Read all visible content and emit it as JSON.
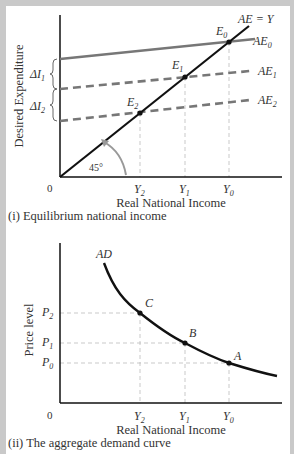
{
  "panel1": {
    "caption": "(i) Equilibrium national income",
    "ylabel": "Desired Expenditure",
    "xlabel": "Real National Income",
    "origin_label": "0",
    "angle_label": "45°",
    "line_label": "AE = Y",
    "x_ticks": [
      {
        "label": "Y",
        "sub": "2"
      },
      {
        "label": "Y",
        "sub": "1"
      },
      {
        "label": "Y",
        "sub": "0"
      }
    ],
    "curves": [
      {
        "label": "AE",
        "sub": "0",
        "style": "solid"
      },
      {
        "label": "AE",
        "sub": "1",
        "style": "dashed"
      },
      {
        "label": "AE",
        "sub": "2",
        "style": "dashed"
      }
    ],
    "points": [
      {
        "label": "E",
        "sub": "0"
      },
      {
        "label": "E",
        "sub": "1"
      },
      {
        "label": "E",
        "sub": "2"
      }
    ],
    "braces": [
      {
        "label": "ΔI",
        "sub": "1"
      },
      {
        "label": "ΔI",
        "sub": "2"
      }
    ]
  },
  "panel2": {
    "caption": "(ii) The aggregate demand curve",
    "ylabel": "Price level",
    "xlabel": "Real National Income",
    "origin_label": "0",
    "curve_label": "AD",
    "x_ticks": [
      {
        "label": "Y",
        "sub": "2"
      },
      {
        "label": "Y",
        "sub": "1"
      },
      {
        "label": "Y",
        "sub": "0"
      }
    ],
    "y_ticks": [
      {
        "label": "P",
        "sub": "2"
      },
      {
        "label": "P",
        "sub": "1"
      },
      {
        "label": "P",
        "sub": "0"
      }
    ],
    "points": [
      {
        "label": "C"
      },
      {
        "label": "B"
      },
      {
        "label": "A"
      }
    ]
  },
  "colors": {
    "frame": "#c9c9c9",
    "axis": "#111111",
    "ae_line": "#777777",
    "guide": "#bbbbbb",
    "text": "#333333"
  }
}
